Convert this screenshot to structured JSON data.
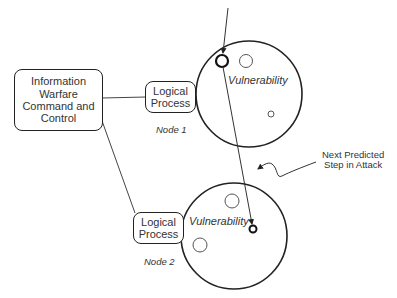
{
  "command_box": {
    "label": "Information\nWarfare\nCommand and\nControl"
  },
  "nodes": [
    {
      "name": "Node 1",
      "process_label": "Logical\nProcess",
      "vulnerability_label": "Vulnerability"
    },
    {
      "name": "Node 2",
      "process_label": "Logical\nProcess",
      "vulnerability_label": "Vulnerability"
    }
  ],
  "annotation": {
    "label": "Next Predicted\nStep in Attack"
  },
  "colors": {
    "stroke": "#222222",
    "text": "#333333",
    "background": "#ffffff"
  }
}
